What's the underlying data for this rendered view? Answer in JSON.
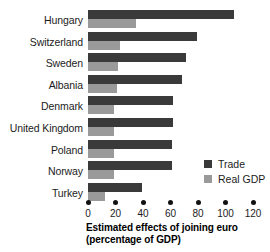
{
  "chart_data": {
    "type": "bar",
    "orientation": "horizontal",
    "title": "",
    "xlabel": "Estimated effects of joining euro (percentage of GDP)",
    "xlabel_lines": [
      "Estimated effects of joining euro",
      "(percentage of GDP)"
    ],
    "ylabel": "",
    "categories": [
      "Hungary",
      "Switzerland",
      "Sweden",
      "Albania",
      "Denmark",
      "United Kingdom",
      "Poland",
      "Norway",
      "Turkey"
    ],
    "series": [
      {
        "name": "Trade",
        "color": "#3a3a3a",
        "values": [
          106,
          79,
          71,
          68,
          62,
          62,
          61,
          61,
          39
        ]
      },
      {
        "name": "Real GDP",
        "color": "#9a9a9a",
        "values": [
          35,
          23,
          22,
          21,
          19,
          19,
          19,
          19,
          12
        ]
      }
    ],
    "xlim": [
      0,
      120
    ],
    "xticks": [
      0,
      20,
      40,
      60,
      80,
      100,
      120
    ],
    "xtick_labels": [
      "0",
      "20",
      "40",
      "60",
      "80",
      "100",
      "120"
    ],
    "grid": false,
    "legend_position": "inside-right"
  },
  "legend": {
    "items": [
      {
        "label": "Trade",
        "color": "#3a3a3a"
      },
      {
        "label": "Real GDP",
        "color": "#9a9a9a"
      }
    ]
  },
  "colors": {
    "trade": "#3a3a3a",
    "real_gdp": "#9a9a9a",
    "axis": "#111111",
    "text": "#1c1c1c",
    "background": "#ffffff"
  }
}
